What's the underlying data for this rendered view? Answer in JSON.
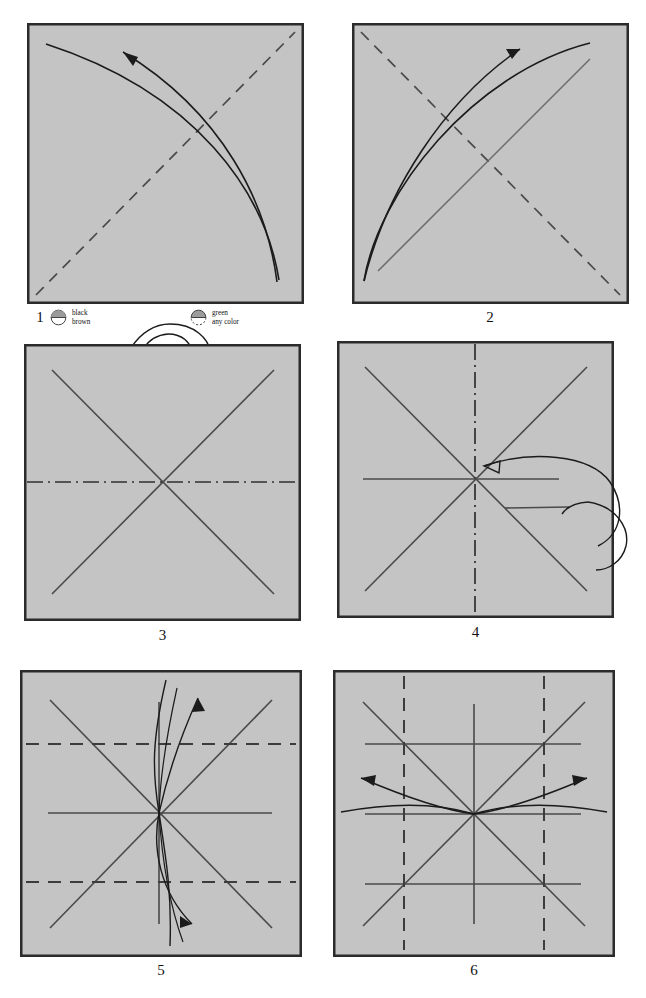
{
  "document": {
    "type": "origami-folding-instructions",
    "total_steps": 6,
    "paper_fill_color": "#c4c4c4",
    "paper_border_color": "#2b2b2b",
    "crease_line_color": "#4a4a4a",
    "arrow_color": "#1a1a1a",
    "background_color": "#ffffff"
  },
  "legend": {
    "items": [
      {
        "swatch": "half-filled-circle-solid",
        "line1": "black",
        "line2": "brown"
      },
      {
        "swatch": "half-filled-circle-dashed",
        "line1": "green",
        "line2": "any color"
      }
    ]
  },
  "steps": [
    {
      "number": "1",
      "caption": "1",
      "description": "Square sheet with dashed diagonal crease from bottom-left to top-right and a valley-fold arrow sweeping from the bottom-right corner to the upper-left corner."
    },
    {
      "number": "2",
      "caption": "2",
      "description": "Square with dashed diagonal from top-left to bottom-right, a solid diagonal crease from bottom-left to top-right, and a fold arrow pointing up to the right."
    },
    {
      "number": "3",
      "caption": "3",
      "description": "Square with both solid diagonals forming an X and a horizontal dash-dot centre line; turn-over arrow entering from above."
    },
    {
      "number": "4",
      "caption": "4",
      "description": "Square with X diagonals, a vertical dash-dot centre line, a horizontal crease, and a wrap-around arrow curving in from the right edge."
    },
    {
      "number": "5",
      "caption": "5",
      "description": "Square with X diagonals, horizontal and vertical centre creases, two horizontal dashed quarter lines, and double-headed curved arrows through the centre."
    },
    {
      "number": "6",
      "caption": "6",
      "description": "Square with X diagonals, three horizontal creases, a vertical centre crease, two vertical dashed quarter lines, and curved arrows fanning out left and right."
    }
  ]
}
